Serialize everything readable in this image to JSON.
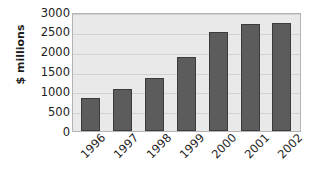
{
  "chart_data": {
    "type": "bar",
    "title": "",
    "subtitle": "",
    "xlabel": "",
    "ylabel": "$ millions",
    "categories": [
      "1996",
      "1997",
      "1998",
      "1999",
      "2000",
      "2001",
      "2002"
    ],
    "values": [
      820,
      1060,
      1330,
      1870,
      2490,
      2690,
      2720
    ],
    "series": [
      {
        "name": "",
        "values": [
          820,
          1060,
          1330,
          1870,
          2490,
          2690,
          2720
        ]
      }
    ],
    "ylim": [
      0,
      3000
    ],
    "ytick_labels": [
      "3000",
      "2500",
      "2000",
      "1500",
      "1000",
      "500",
      "0"
    ],
    "ytick_values": [
      3000,
      2500,
      2000,
      1500,
      1000,
      500,
      0
    ],
    "grid": true,
    "legend": "none",
    "colors": {
      "bar_fill": "#5c5c5c",
      "bar_border": "#3b3b3b",
      "plot_background": "#e9e9e9",
      "gridline": "#d2d2d2",
      "frame": "#b4b4b4",
      "text": "#1d1d1d",
      "page_background": "#ffffff"
    }
  }
}
